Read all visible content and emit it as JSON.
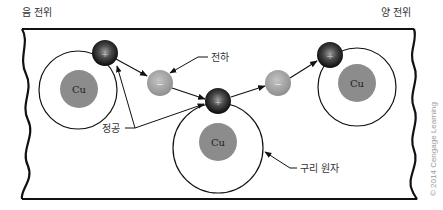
{
  "labels": {
    "negative_potential": "음 전위",
    "positive_potential": "양 전위",
    "charge": "전하",
    "hole": "정공",
    "copper_atom": "구리 원자",
    "copyright": "© 2014 Cengage Learning"
  },
  "atoms": [
    {
      "symbol": "Cu"
    },
    {
      "symbol": "Cu"
    },
    {
      "symbol": "Cu"
    }
  ],
  "particles": {
    "hole_sign": "+",
    "electron_sign": "−"
  },
  "colors": {
    "nucleus": "#8c8c8c",
    "electron": "#a6a6a6",
    "hole": "#1a1a1a",
    "line": "#111111"
  }
}
